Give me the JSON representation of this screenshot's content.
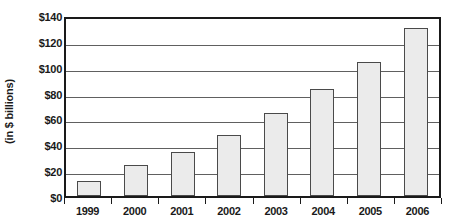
{
  "chart_data": {
    "type": "bar",
    "title": "",
    "subtitle": "",
    "xlabel": "",
    "ylabel": "(in $ billions)",
    "categories": [
      "1999",
      "2000",
      "2001",
      "2002",
      "2003",
      "2004",
      "2005",
      "2006"
    ],
    "values": [
      12,
      24,
      34,
      47,
      64,
      83,
      104,
      130
    ],
    "series": [
      {
        "name": "",
        "values": [
          12,
          24,
          34,
          47,
          64,
          83,
          104,
          130
        ]
      }
    ],
    "ylim": [
      0,
      140
    ],
    "ytick_values": [
      0,
      20,
      40,
      60,
      80,
      100,
      120,
      140
    ],
    "ytick_labels": [
      "$0",
      "$20",
      "$40",
      "$60",
      "$80",
      "$100",
      "$120",
      "$140"
    ],
    "grid": true,
    "grid_axis": "y",
    "legend": false,
    "legend_position": "none",
    "bar_fill_color": "#ebebeb",
    "bar_border_color": "#4a4a4a",
    "gridline_color": "#606060",
    "axis_color": "#1a1a1a",
    "text_color": "#1a1a1a",
    "background_color": "#ffffff"
  }
}
